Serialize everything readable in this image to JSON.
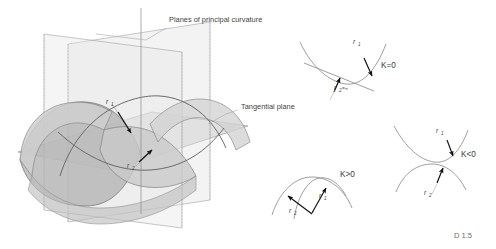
{
  "figure": {
    "caption": "D 1.5",
    "labels": {
      "planes_of_principal_curvature": "Planes of principal curvature",
      "tangential_plane": "Tangential plane",
      "r1": "r",
      "r1_sub": "1",
      "r2": "r",
      "r2_sub": "2"
    },
    "insets": [
      {
        "id": "k-zero",
        "curvature_label": "K=0",
        "radius_labels": [
          {
            "symbol": "r",
            "sub": "1"
          },
          {
            "symbol": "r",
            "sub": "2",
            "value": "=∞"
          }
        ]
      },
      {
        "id": "k-negative",
        "curvature_label": "K<0",
        "radius_labels": [
          {
            "symbol": "r",
            "sub": "1"
          },
          {
            "symbol": "r",
            "sub": "2"
          }
        ]
      },
      {
        "id": "k-positive",
        "curvature_label": "K>0",
        "radius_labels": [
          {
            "symbol": "r",
            "sub": "1"
          },
          {
            "symbol": "r",
            "sub": "2"
          }
        ]
      }
    ],
    "colors": {
      "background": "#ffffff",
      "line": "#7d7d7d",
      "line_dark": "#5a5a5a",
      "surface_light": "#d9d9d9",
      "surface_mid": "#c4c4c4",
      "surface_dark": "#a9a9a9",
      "plane_fill": "#cfcfcf",
      "text": "#3f3f3f",
      "caption_text": "#6d6d6d",
      "arrow": "#111111"
    }
  }
}
